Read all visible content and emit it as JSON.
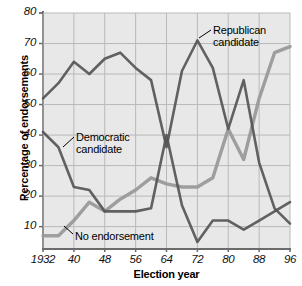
{
  "chart_data": {
    "type": "line",
    "title": "",
    "xlabel": "Election year",
    "ylabel": "Percentage of endorsements",
    "xlim": [
      1932,
      1996
    ],
    "ylim": [
      3,
      80
    ],
    "grid": true,
    "legend_position": "inline-annotations",
    "xticks": [
      "1932",
      "40",
      "48",
      "56",
      "64",
      "72",
      "80",
      "88",
      "96"
    ],
    "xtick_values": [
      1932,
      1940,
      1948,
      1956,
      1964,
      1972,
      1980,
      1988,
      1996
    ],
    "yticks": [
      "10",
      "20",
      "30",
      "40",
      "50",
      "60",
      "70",
      "80"
    ],
    "ytick_values": [
      10,
      20,
      30,
      40,
      50,
      60,
      70,
      80
    ],
    "x": [
      1932,
      1936,
      1940,
      1944,
      1948,
      1952,
      1956,
      1960,
      1964,
      1968,
      1972,
      1976,
      1980,
      1984,
      1988,
      1992,
      1996
    ],
    "series": [
      {
        "name": "Republican candidate",
        "color": "#555555",
        "values": [
          52,
          57,
          64,
          60,
          65,
          67,
          62,
          58,
          36,
          61,
          71,
          62,
          42,
          58,
          31,
          16,
          11
        ]
      },
      {
        "name": "Democratic candidate",
        "color": "#555555",
        "values": [
          41,
          36,
          23,
          22,
          15,
          15,
          15,
          16,
          40,
          17,
          5,
          12,
          12,
          9,
          12,
          15,
          18
        ]
      },
      {
        "name": "No endorsement",
        "color": "#9a9a9a",
        "values": [
          7,
          7,
          12,
          18,
          15,
          19,
          22,
          26,
          24,
          23,
          23,
          26,
          42,
          32,
          52,
          67,
          69
        ]
      }
    ],
    "annotations": [
      {
        "id": "republican",
        "label": "Republican\ncandidate"
      },
      {
        "id": "democratic",
        "label": "Democratic\ncandidate"
      },
      {
        "id": "no-endorsement",
        "label": "No endorsement"
      }
    ],
    "colors": {
      "plot_background": "#e8e8e8",
      "gridline": "#b9b9b9",
      "axis": "#6b6b6b",
      "dark_series": "#555555",
      "light_series": "#9a9a9a"
    }
  }
}
